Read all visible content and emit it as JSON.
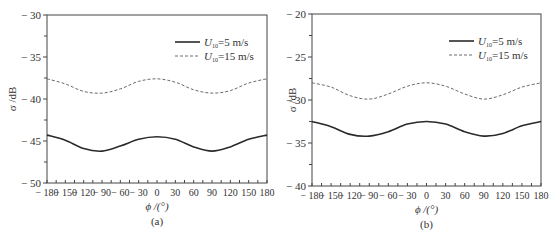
{
  "chart_data": [
    {
      "type": "line",
      "panel_label": "(a)",
      "title": "",
      "xlabel": "ϕ /(°)",
      "ylabel": "σ /dB",
      "xlim": [
        -180,
        180
      ],
      "ylim": [
        -50,
        -30
      ],
      "x_ticks": [
        -180,
        -150,
        -120,
        -90,
        -60,
        -30,
        0,
        30,
        60,
        90,
        120,
        150,
        180
      ],
      "x_tick_labels": [
        "− 180",
        "− 150",
        "− 120",
        "− 90",
        "− 60",
        "− 30",
        "0",
        "30",
        "60",
        "90",
        "120",
        "150",
        "180"
      ],
      "y_ticks": [
        -50,
        -45,
        -40,
        -35,
        -30
      ],
      "y_tick_labels": [
        "− 50",
        "− 45",
        "− 40",
        "− 35",
        "− 30"
      ],
      "grid": false,
      "legend_position": "upper right",
      "x": [
        -180,
        -150,
        -120,
        -90,
        -60,
        -30,
        0,
        30,
        60,
        90,
        120,
        150,
        180
      ],
      "series": [
        {
          "name": "U10=5 m/s",
          "style": "solid",
          "values": [
            -44.3,
            -44.9,
            -45.9,
            -46.2,
            -45.6,
            -44.8,
            -44.5,
            -44.8,
            -45.7,
            -46.2,
            -45.7,
            -44.8,
            -44.3
          ]
        },
        {
          "name": "U10=15 m/s",
          "style": "dashed",
          "values": [
            -37.6,
            -38.2,
            -39.1,
            -39.3,
            -38.8,
            -37.9,
            -37.6,
            -38.0,
            -38.9,
            -39.3,
            -39.0,
            -38.1,
            -37.6
          ]
        }
      ]
    },
    {
      "type": "line",
      "panel_label": "(b)",
      "title": "",
      "xlabel": "ϕ /(°)",
      "ylabel": "σ /dB",
      "xlim": [
        -180,
        180
      ],
      "ylim": [
        -40,
        -20
      ],
      "x_ticks": [
        -180,
        -150,
        -120,
        -90,
        -60,
        -30,
        0,
        30,
        60,
        90,
        120,
        150,
        180
      ],
      "x_tick_labels": [
        "− 180",
        "− 150",
        "− 120",
        "− 90",
        "− 60",
        "− 30",
        "0",
        "30",
        "60",
        "90",
        "120",
        "150",
        "180"
      ],
      "y_ticks": [
        -40,
        -35,
        -30,
        -25,
        -20
      ],
      "y_tick_labels": [
        "− 40",
        "− 35",
        "− 30",
        "− 25",
        "− 20"
      ],
      "grid": false,
      "legend_position": "upper right",
      "x": [
        -180,
        -150,
        -120,
        -90,
        -60,
        -30,
        0,
        30,
        60,
        90,
        120,
        150,
        180
      ],
      "series": [
        {
          "name": "U10=5 m/s",
          "style": "solid",
          "values": [
            -32.5,
            -33.1,
            -34.0,
            -34.2,
            -33.7,
            -32.8,
            -32.5,
            -32.8,
            -33.7,
            -34.2,
            -33.9,
            -33.0,
            -32.5
          ]
        },
        {
          "name": "U10=15 m/s",
          "style": "dashed",
          "values": [
            -28.0,
            -28.5,
            -29.5,
            -29.9,
            -29.3,
            -28.4,
            -28.0,
            -28.4,
            -29.3,
            -29.9,
            -29.4,
            -28.5,
            -28.0
          ]
        }
      ]
    }
  ],
  "legend": {
    "items": [
      {
        "symbol": "U",
        "subscript": "10",
        "text": "=5 m/s",
        "style": "solid"
      },
      {
        "symbol": "U",
        "subscript": "10",
        "text": "=15 m/s",
        "style": "dashed"
      }
    ]
  },
  "colors": {
    "solid_line": "#2a2a2a",
    "dashed_line": "#6a6a6a",
    "axis": "#444444"
  }
}
